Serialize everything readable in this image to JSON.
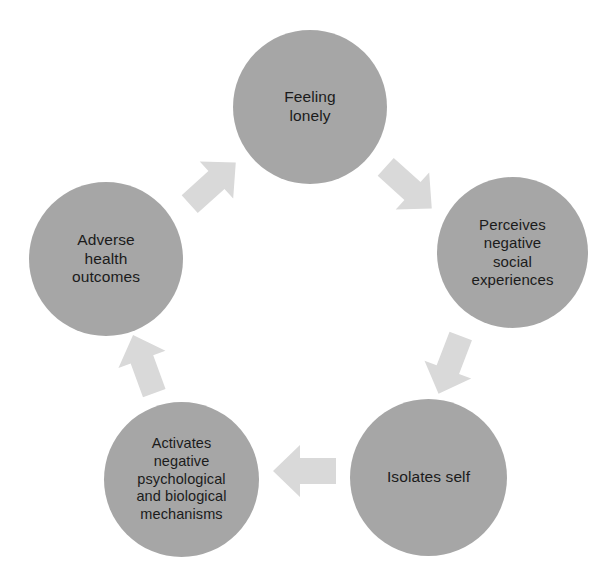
{
  "diagram": {
    "type": "cycle",
    "direction": "clockwise",
    "background_color": "#ffffff",
    "node_fill_color": "#a6a6a6",
    "node_text_color": "#1b1b1b",
    "arrow_fill_color": "#d9d9d9",
    "nodes": [
      {
        "id": "feeling-lonely",
        "label": "Feeling\nlonely",
        "position": "top"
      },
      {
        "id": "perceives-negative-social-experiences",
        "label": "Perceives\nnegative\nsocial\nexperiences",
        "position": "right"
      },
      {
        "id": "isolates-self",
        "label": "Isolates self",
        "position": "bottom-right"
      },
      {
        "id": "activates-negative-mechanisms",
        "label": "Activates\nnegative\npsychological\nand biological\nmechanisms",
        "position": "bottom-left"
      },
      {
        "id": "adverse-health-outcomes",
        "label": "Adverse\nhealth\noutcomes",
        "position": "left"
      }
    ],
    "arrows": [
      {
        "id": "arrow-lonely-to-perceives",
        "from": "feeling-lonely",
        "to": "perceives-negative-social-experiences",
        "direction": "down-right"
      },
      {
        "id": "arrow-perceives-to-isolates",
        "from": "perceives-negative-social-experiences",
        "to": "isolates-self",
        "direction": "down-left"
      },
      {
        "id": "arrow-isolates-to-activates",
        "from": "isolates-self",
        "to": "activates-negative-mechanisms",
        "direction": "left"
      },
      {
        "id": "arrow-activates-to-adverse",
        "from": "activates-negative-mechanisms",
        "to": "adverse-health-outcomes",
        "direction": "up-left"
      },
      {
        "id": "arrow-adverse-to-lonely",
        "from": "adverse-health-outcomes",
        "to": "feeling-lonely",
        "direction": "up-right"
      }
    ]
  }
}
